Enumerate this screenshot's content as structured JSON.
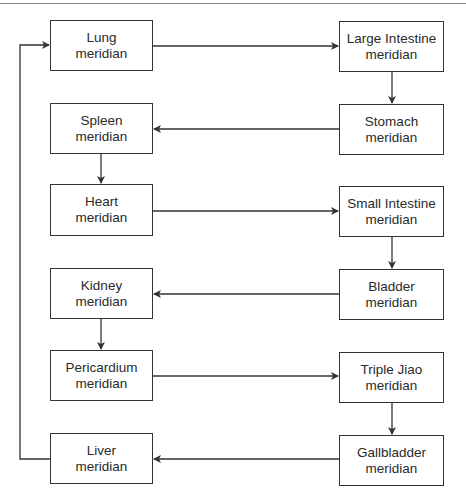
{
  "diagram": {
    "title": "",
    "nodes": [
      {
        "id": "lung",
        "line1": "Lung",
        "line2": "meridian",
        "x": 50,
        "y": 20,
        "w": 103,
        "h": 51
      },
      {
        "id": "large_intestine",
        "line1": "Large Intestine",
        "line2": "meridian",
        "x": 339,
        "y": 21,
        "w": 105,
        "h": 51
      },
      {
        "id": "stomach",
        "line1": "Stomach",
        "line2": "meridian",
        "x": 339,
        "y": 104,
        "w": 105,
        "h": 51
      },
      {
        "id": "spleen",
        "line1": "Spleen",
        "line2": "meridian",
        "x": 50,
        "y": 103,
        "w": 103,
        "h": 51
      },
      {
        "id": "heart",
        "line1": "Heart",
        "line2": "meridian",
        "x": 50,
        "y": 184,
        "w": 103,
        "h": 52
      },
      {
        "id": "small_intestine",
        "line1": "Small Intestine",
        "line2": "meridian",
        "x": 339,
        "y": 186,
        "w": 105,
        "h": 51
      },
      {
        "id": "bladder",
        "line1": "Bladder",
        "line2": "meridian",
        "x": 339,
        "y": 269,
        "w": 105,
        "h": 51
      },
      {
        "id": "kidney",
        "line1": "Kidney",
        "line2": "meridian",
        "x": 50,
        "y": 268,
        "w": 103,
        "h": 51
      },
      {
        "id": "pericardium",
        "line1": "Pericardium",
        "line2": "meridian",
        "x": 50,
        "y": 350,
        "w": 103,
        "h": 51
      },
      {
        "id": "triple_jiao",
        "line1": "Triple Jiao",
        "line2": "meridian",
        "x": 339,
        "y": 352,
        "w": 105,
        "h": 51
      },
      {
        "id": "gallbladder",
        "line1": "Gallbladder",
        "line2": "meridian",
        "x": 339,
        "y": 435,
        "w": 105,
        "h": 51
      },
      {
        "id": "liver",
        "line1": "Liver",
        "line2": "meridian",
        "x": 50,
        "y": 433,
        "w": 103,
        "h": 51
      }
    ],
    "edges": [
      {
        "from": "lung",
        "to": "large_intestine"
      },
      {
        "from": "large_intestine",
        "to": "stomach"
      },
      {
        "from": "stomach",
        "to": "spleen"
      },
      {
        "from": "spleen",
        "to": "heart"
      },
      {
        "from": "heart",
        "to": "small_intestine"
      },
      {
        "from": "small_intestine",
        "to": "bladder"
      },
      {
        "from": "bladder",
        "to": "kidney"
      },
      {
        "from": "kidney",
        "to": "pericardium"
      },
      {
        "from": "pericardium",
        "to": "triple_jiao"
      },
      {
        "from": "triple_jiao",
        "to": "gallbladder"
      },
      {
        "from": "gallbladder",
        "to": "liver"
      },
      {
        "from": "liver",
        "to": "lung"
      }
    ],
    "colors": {
      "line": "#333333",
      "box_border": "#333333",
      "text": "#2a2a2a",
      "background": "#ffffff"
    }
  }
}
